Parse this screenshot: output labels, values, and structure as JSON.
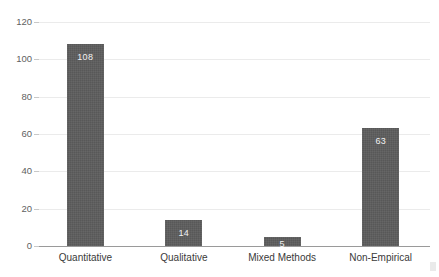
{
  "chart_data": {
    "type": "bar",
    "title": "",
    "xlabel": "",
    "ylabel": "",
    "categories": [
      "Quantitative",
      "Qualitative",
      "Mixed Methods",
      "Non-Empirical"
    ],
    "values": [
      108,
      14,
      5,
      63
    ],
    "value_labels": [
      "108",
      "14",
      "5",
      "63"
    ],
    "ylim": [
      0,
      120
    ],
    "yticks": [
      0,
      20,
      40,
      60,
      80,
      100,
      120
    ],
    "ytick_labels": [
      "0",
      "20",
      "40",
      "60",
      "80",
      "100",
      "120"
    ],
    "grid": true,
    "grid_axis": "y",
    "legend": false,
    "bar_color": "#585858",
    "label_color": "#f2f2f2",
    "gridline_color": "#ebebeb",
    "axis_color": "#9a9a9a",
    "tick_text_color": "#5f5f5f",
    "category_text_color": "#3a3a3a",
    "background_color": "#ffffff"
  }
}
